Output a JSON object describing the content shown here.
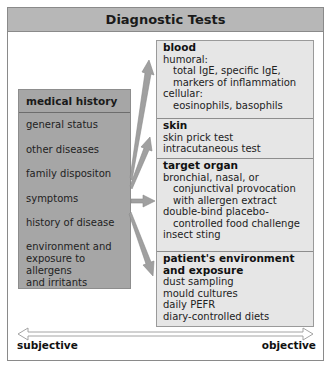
{
  "title": "Diagnostic Tests",
  "medical_history": {
    "title": "medical history",
    "items": [
      "general status",
      "other diseases",
      "family dispositon",
      "symptoms",
      "history of disease",
      "environment and",
      "exposure to",
      "allergens",
      "and irritants"
    ]
  },
  "tests": {
    "blood": {
      "title": "blood",
      "lines": [
        "humoral:",
        "total IgE, specific IgE,",
        "markers of inflammation",
        "cellular:",
        "eosinophils, basophils"
      ]
    },
    "skin": {
      "title": "skin",
      "lines": [
        "skin prick test",
        "intracutaneous test"
      ]
    },
    "target_organ": {
      "title": "target  organ",
      "lines": [
        "bronchial, nasal, or",
        "conjunctival provocation",
        "with allergen extract",
        "double-bind placebo-",
        "controlled food challenge",
        "insect sting"
      ]
    },
    "environment": {
      "title_line1": "patient's environment",
      "title_line2": "and exposure",
      "lines": [
        "dust sampling",
        "mould cultures",
        "daily PEFR",
        "diary-controlled diets"
      ]
    }
  },
  "scale": {
    "left_label": "subjective",
    "right_label": "objective"
  },
  "colors": {
    "header_bg": "#b7b7b7",
    "left_box_bg": "#a6a6a6",
    "right_box_bg": "#e6e6e6",
    "arrow_fill": "#a0a0a0"
  }
}
